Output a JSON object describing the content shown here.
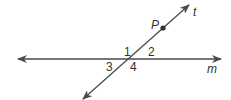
{
  "diagram": {
    "type": "geometry",
    "colors": {
      "line": "#4a4a4a",
      "point": "#333333",
      "text": "#333333"
    },
    "lines": [
      {
        "name": "m",
        "label": "m",
        "x1": 18,
        "y1": 59,
        "x2": 221,
        "y2": 59,
        "arrows": "both"
      },
      {
        "name": "t",
        "label": "t",
        "x1": 83,
        "y1": 99,
        "x2": 189,
        "y2": 5,
        "arrows": "both"
      }
    ],
    "points": [
      {
        "name": "P",
        "label": "P",
        "x": 163,
        "y": 28
      }
    ],
    "intersection": {
      "x": 131,
      "y": 59
    },
    "angles": [
      {
        "label": "1",
        "x": 124,
        "y": 56
      },
      {
        "label": "2",
        "x": 148,
        "y": 56
      },
      {
        "label": "3",
        "x": 106,
        "y": 71
      },
      {
        "label": "4",
        "x": 130,
        "y": 71
      }
    ],
    "line_labels": {
      "t": {
        "text": "t",
        "x": 193,
        "y": 16
      },
      "m": {
        "text": "m",
        "x": 207,
        "y": 73
      }
    },
    "point_labels": {
      "P": {
        "text": "P",
        "x": 151,
        "y": 29
      }
    }
  }
}
